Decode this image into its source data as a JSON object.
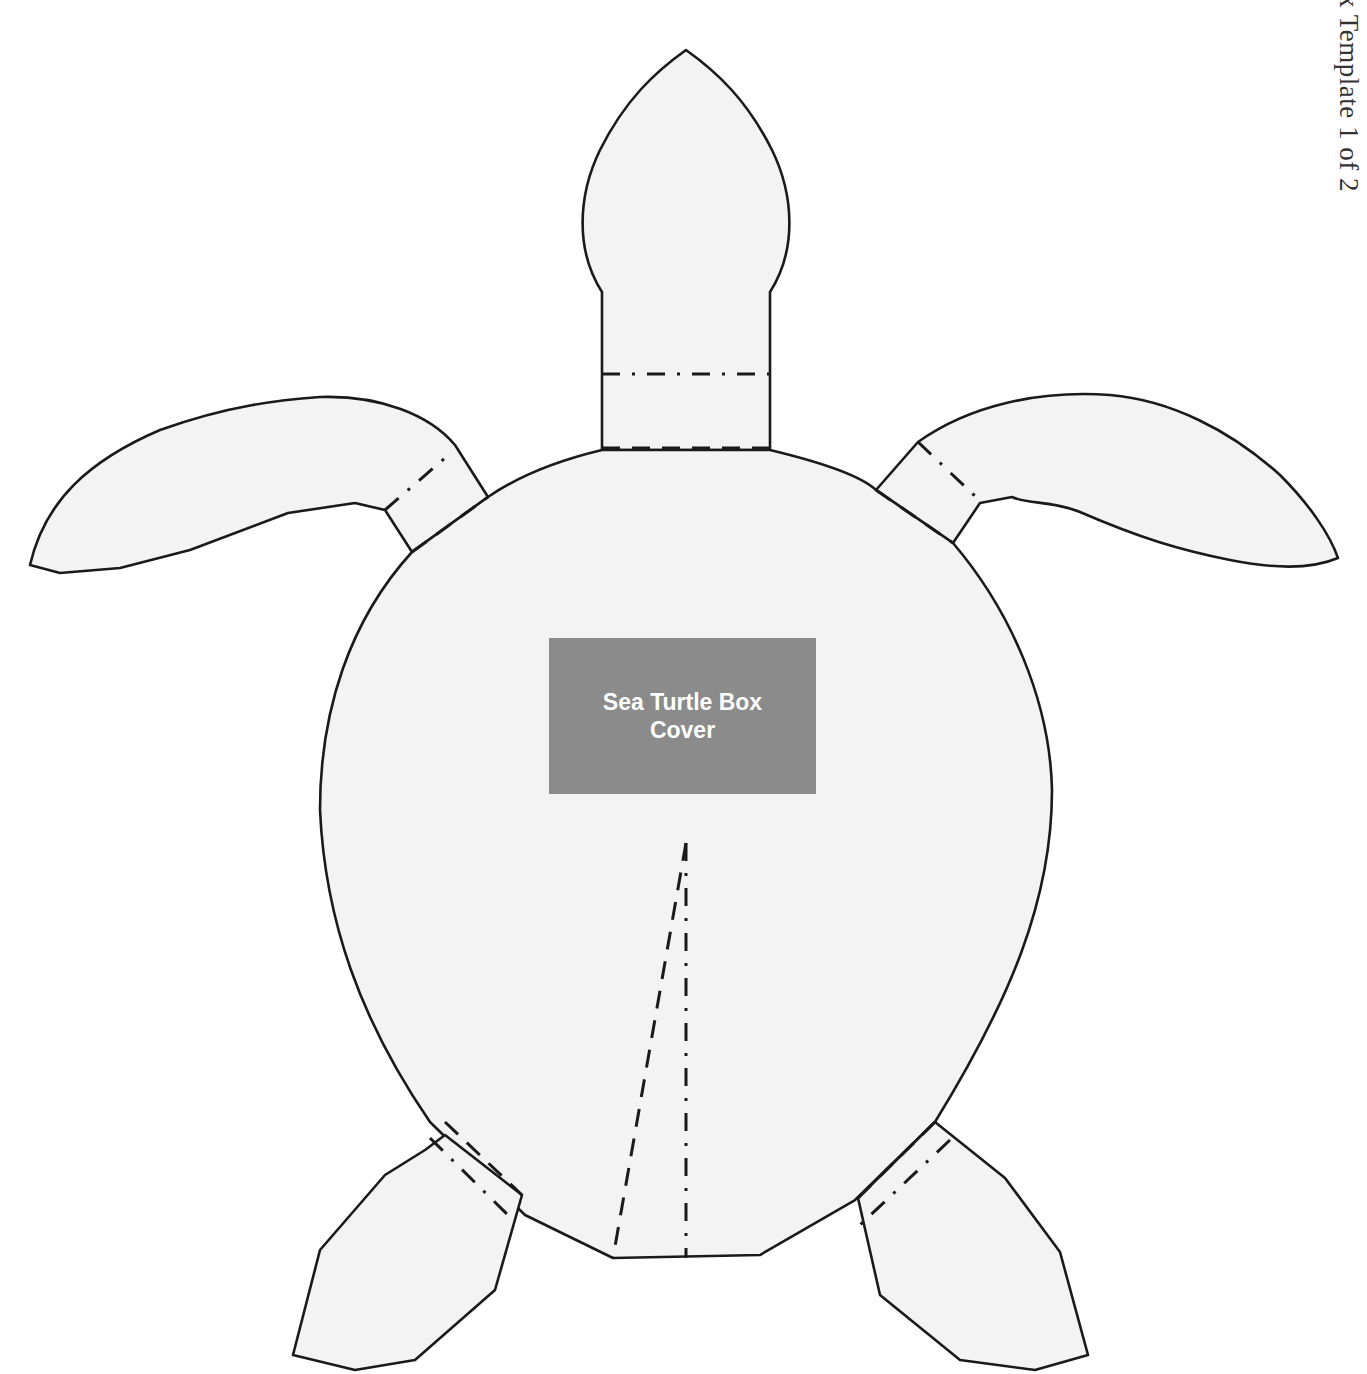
{
  "page": {
    "side_title": "x Template 1 of 2",
    "background_color": "#ffffff"
  },
  "template": {
    "subject": "Sea Turtle",
    "fill_color": "#f3f3f3",
    "stroke_color": "#1a1a1a",
    "parts": [
      "head",
      "neck",
      "shell",
      "left-front-flipper",
      "right-front-flipper",
      "left-rear-flipper",
      "right-rear-flipper",
      "tail-gusset"
    ],
    "line_legend": {
      "solid": "cut line",
      "dashed": "fold line",
      "dash-dot": "fold line"
    }
  },
  "label": {
    "line1": "Sea Turtle Box",
    "line2": "Cover",
    "box_color": "#8b8b8b",
    "text_color": "#ffffff"
  }
}
